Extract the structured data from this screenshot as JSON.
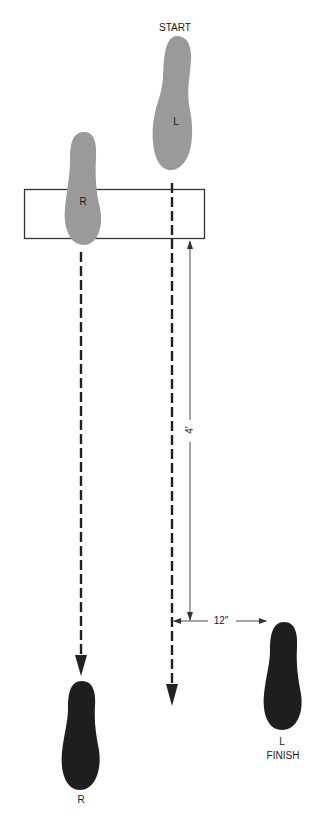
{
  "diagram": {
    "type": "footstep-pattern",
    "labels": {
      "start": "START",
      "finish": "FINISH",
      "start_foot": "L",
      "box_foot": "R",
      "finish_left_foot": "L",
      "finish_right_foot": "R",
      "forward_distance": "4′",
      "lateral_distance": "12″"
    },
    "colors": {
      "start_footprint": "#9a9a9a",
      "finish_footprint": "#1e1e1e",
      "lines": "#222222",
      "box": "#333333"
    },
    "footprints": [
      {
        "id": "start-left",
        "foot": "L",
        "phase": "start"
      },
      {
        "id": "start-right",
        "foot": "R",
        "phase": "start",
        "in_box": true
      },
      {
        "id": "finish-right",
        "foot": "R",
        "phase": "finish"
      },
      {
        "id": "finish-left",
        "foot": "L",
        "phase": "finish"
      }
    ]
  }
}
